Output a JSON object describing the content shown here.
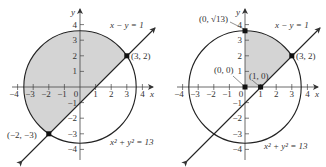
{
  "colors": {
    "shade": "#d4d4d4",
    "ink": "#222222"
  },
  "left_panel": {
    "axis_x_label": "x",
    "axis_y_label": "y",
    "x_ticks": [
      "−4",
      "−3",
      "−2",
      "−1",
      "0",
      "1",
      "2",
      "3",
      "4"
    ],
    "y_ticks": [
      "4",
      "3",
      "2",
      "1",
      "−1",
      "−2",
      "−3",
      "−4"
    ],
    "line_label": "x − y = 1",
    "circle_label": "x² + y² = 13",
    "points": [
      {
        "label": "(3, 2)",
        "x": 3,
        "y": 2
      },
      {
        "label": "(−2, −3)",
        "x": -2,
        "y": -3
      }
    ],
    "shaded_region": "circle interior above the line x − y = 1"
  },
  "right_panel": {
    "axis_x_label": "x",
    "axis_y_label": "y",
    "x_ticks": [
      "−4",
      "−3",
      "−2",
      "−1",
      "0",
      "1",
      "2",
      "3",
      "4"
    ],
    "y_ticks": [
      "4",
      "3",
      "2",
      "1",
      "−1",
      "−2",
      "−3",
      "−4"
    ],
    "line_label": "x − y = 1",
    "circle_label": "x² + y² = 13",
    "points": [
      {
        "label": "(0, √13)",
        "x": 0,
        "y": 3.606
      },
      {
        "label": "(3, 2)",
        "x": 3,
        "y": 2
      },
      {
        "label": "(0, 0)",
        "x": 0,
        "y": 0
      },
      {
        "label": "(1, 0)",
        "x": 1,
        "y": 0
      }
    ],
    "shaded_region": "first-quadrant region inside circle, above line x − y = 1"
  }
}
